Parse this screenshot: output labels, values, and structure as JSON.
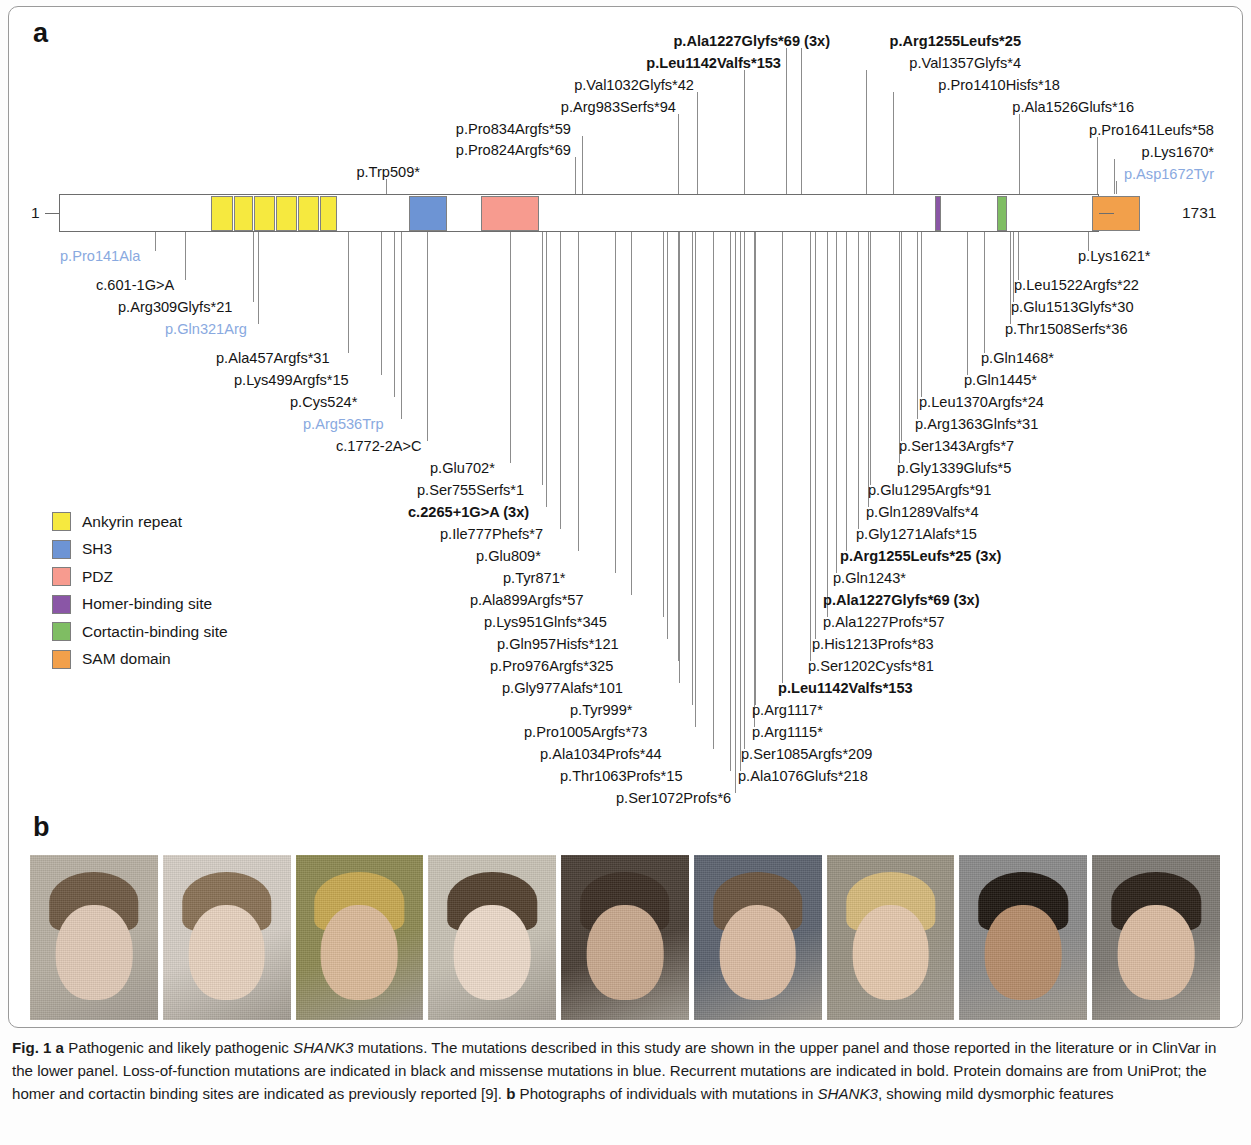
{
  "figure": {
    "panel_a_letter": "a",
    "panel_b_letter": "b",
    "caption_parts": {
      "fig_label": "Fig. 1",
      "a_tag": "a",
      "a_text_1": " Pathogenic and likely pathogenic ",
      "gene_1": "SHANK3",
      "a_text_2": " mutations. The mutations described in this study are shown in the upper panel and those reported in the literature or in ClinVar in the lower panel. Loss-of-function mutations are indicated in black and missense mutations in blue. Recurrent mutations are indicated in bold. Protein domains are from UniProt; the homer and cortactin binding sites are indicated as previously reported [9]. ",
      "b_tag": "b",
      "b_text_1": " Photographs of individuals with mutations in ",
      "gene_2": "SHANK3",
      "b_text_2": ", showing mild dysmorphic features"
    }
  },
  "protein": {
    "n_terminus_label": "1",
    "c_terminus_label": "1731",
    "length_aa": 1731,
    "domains": [
      {
        "name": "Ankyrin repeat",
        "color": "#f6e93f",
        "start_px": 152,
        "width_px": 22
      },
      {
        "name": "Ankyrin repeat",
        "color": "#f6e93f",
        "start_px": 175,
        "width_px": 19
      },
      {
        "name": "Ankyrin repeat",
        "color": "#f6e93f",
        "start_px": 195,
        "width_px": 21
      },
      {
        "name": "Ankyrin repeat",
        "color": "#f6e93f",
        "start_px": 217,
        "width_px": 21
      },
      {
        "name": "Ankyrin repeat",
        "color": "#f6e93f",
        "start_px": 239,
        "width_px": 21
      },
      {
        "name": "Ankyrin repeat",
        "color": "#f6e93f",
        "start_px": 261,
        "width_px": 17
      },
      {
        "name": "SH3",
        "color": "#6d94d4",
        "start_px": 350,
        "width_px": 38
      },
      {
        "name": "PDZ",
        "color": "#f79b8f",
        "start_px": 422,
        "width_px": 58
      },
      {
        "name": "Homer-binding site",
        "color": "#8a56a6",
        "start_px": 876,
        "width_px": 6
      },
      {
        "name": "Cortactin-binding site",
        "color": "#7fbd63",
        "start_px": 938,
        "width_px": 10
      },
      {
        "name": "SAM domain",
        "color": "#f2a04b",
        "start_px": 1033,
        "width_px": 48
      }
    ]
  },
  "legend": {
    "items": [
      {
        "label": "Ankyrin repeat",
        "color": "#f6e93f"
      },
      {
        "label": "SH3",
        "color": "#6d94d4"
      },
      {
        "label": "PDZ",
        "color": "#f79b8f"
      },
      {
        "label": "Homer-binding site",
        "color": "#8a56a6"
      },
      {
        "label": "Cortactin-binding site",
        "color": "#7fbd63"
      },
      {
        "label": "SAM domain",
        "color": "#f2a04b"
      }
    ]
  },
  "mutations_upper": [
    {
      "label": "p.Trp509*",
      "text_x": 420,
      "text_y": 165,
      "align": "right",
      "anchor_x": 386,
      "bold": false,
      "blue": false
    },
    {
      "label": "p.Pro824Argfs*69",
      "text_x": 571,
      "text_y": 143,
      "align": "right",
      "anchor_x": 575,
      "bold": false,
      "blue": false
    },
    {
      "label": "p.Pro834Argfs*59",
      "text_x": 571,
      "text_y": 122,
      "align": "right",
      "anchor_x": 582,
      "bold": false,
      "blue": false
    },
    {
      "label": "p.Arg983Serfs*94",
      "text_x": 676,
      "text_y": 100,
      "align": "right",
      "anchor_x": 678,
      "bold": false,
      "blue": false
    },
    {
      "label": "p.Val1032Glyfs*42",
      "text_x": 694,
      "text_y": 78,
      "align": "right",
      "anchor_x": 697,
      "bold": false,
      "blue": false
    },
    {
      "label": "p.Leu1142Valfs*153",
      "text_x": 781,
      "text_y": 56,
      "align": "right",
      "anchor_x": 744,
      "bold": true,
      "blue": false
    },
    {
      "label": "p.Ala1227Glyfs*69 (3x)",
      "text_x": 830,
      "text_y": 34,
      "align": "right",
      "anchor_x": 786,
      "bold": true,
      "blue": false
    },
    {
      "label": "p.Arg1255Leufs*25",
      "text_x": 1021,
      "text_y": 34,
      "align": "right",
      "anchor_x": 801,
      "bold": true,
      "blue": false
    },
    {
      "label": "p.Val1357Glyfs*4",
      "text_x": 1021,
      "text_y": 56,
      "align": "right",
      "anchor_x": 866,
      "bold": false,
      "blue": false
    },
    {
      "label": "p.Pro1410Hisfs*18",
      "text_x": 1060,
      "text_y": 78,
      "align": "right",
      "anchor_x": 893,
      "bold": false,
      "blue": false
    },
    {
      "label": "p.Ala1526Glufs*16",
      "text_x": 1134,
      "text_y": 100,
      "align": "right",
      "anchor_x": 1019,
      "bold": false,
      "blue": false
    },
    {
      "label": "p.Pro1641Leufs*58",
      "text_x": 1214,
      "text_y": 123,
      "align": "right",
      "anchor_x": 1097,
      "bold": false,
      "blue": false
    },
    {
      "label": "p.Lys1670*",
      "text_x": 1214,
      "text_y": 145,
      "align": "right",
      "anchor_x": 1114,
      "bold": false,
      "blue": false
    },
    {
      "label": "p.Asp1672Tyr",
      "text_x": 1214,
      "text_y": 167,
      "align": "right",
      "anchor_x": 1116,
      "bold": false,
      "blue": true
    }
  ],
  "mutations_lower_left": [
    {
      "label": "p.Pro141Ala",
      "text_x": 60,
      "text_y": 249,
      "anchor_x": 155,
      "bold": false,
      "blue": true
    },
    {
      "label": "c.601-1G>A",
      "text_x": 96,
      "text_y": 278,
      "anchor_x": 185,
      "bold": false,
      "blue": false
    },
    {
      "label": "p.Arg309Glyfs*21",
      "text_x": 118,
      "text_y": 300,
      "anchor_x": 253,
      "bold": false,
      "blue": false
    },
    {
      "label": "p.Gln321Arg",
      "text_x": 165,
      "text_y": 322,
      "anchor_x": 258,
      "bold": false,
      "blue": true
    },
    {
      "label": "p.Ala457Argfs*31",
      "text_x": 216,
      "text_y": 351,
      "anchor_x": 348,
      "bold": false,
      "blue": false
    },
    {
      "label": "p.Lys499Argfs*15",
      "text_x": 234,
      "text_y": 373,
      "anchor_x": 381,
      "bold": false,
      "blue": false
    },
    {
      "label": "p.Cys524*",
      "text_x": 290,
      "text_y": 395,
      "anchor_x": 394,
      "bold": false,
      "blue": false
    },
    {
      "label": "p.Arg536Trp",
      "text_x": 303,
      "text_y": 417,
      "anchor_x": 401,
      "bold": false,
      "blue": true
    },
    {
      "label": "c.1772-2A>C",
      "text_x": 336,
      "text_y": 439,
      "anchor_x": 427,
      "bold": false,
      "blue": false
    },
    {
      "label": "p.Glu702*",
      "text_x": 430,
      "text_y": 461,
      "anchor_x": 510,
      "bold": false,
      "blue": false
    },
    {
      "label": "p.Ser755Serfs*1",
      "text_x": 417,
      "text_y": 483,
      "anchor_x": 542,
      "bold": false,
      "blue": false
    },
    {
      "label": "c.2265+1G>A (3x)",
      "text_x": 408,
      "text_y": 505,
      "anchor_x": 546,
      "bold": true,
      "blue": false
    },
    {
      "label": "p.Ile777Phefs*7",
      "text_x": 440,
      "text_y": 527,
      "anchor_x": 560,
      "bold": false,
      "blue": false
    },
    {
      "label": "p.Glu809*",
      "text_x": 476,
      "text_y": 549,
      "anchor_x": 578,
      "bold": false,
      "blue": false
    },
    {
      "label": "p.Tyr871*",
      "text_x": 503,
      "text_y": 571,
      "anchor_x": 615,
      "bold": false,
      "blue": false
    },
    {
      "label": "p.Ala899Argfs*57",
      "text_x": 470,
      "text_y": 593,
      "anchor_x": 631,
      "bold": false,
      "blue": false
    },
    {
      "label": "p.Lys951Glnfs*345",
      "text_x": 484,
      "text_y": 615,
      "anchor_x": 663,
      "bold": false,
      "blue": false
    },
    {
      "label": "p.Gln957Hisfs*121",
      "text_x": 497,
      "text_y": 637,
      "anchor_x": 667,
      "bold": false,
      "blue": false
    },
    {
      "label": "p.Pro976Argfs*325",
      "text_x": 490,
      "text_y": 659,
      "anchor_x": 678,
      "bold": false,
      "blue": false
    },
    {
      "label": "p.Gly977Alafs*101",
      "text_x": 502,
      "text_y": 681,
      "anchor_x": 679,
      "bold": false,
      "blue": false
    },
    {
      "label": "p.Tyr999*",
      "text_x": 570,
      "text_y": 703,
      "anchor_x": 692,
      "bold": false,
      "blue": false
    },
    {
      "label": "p.Pro1005Argfs*73",
      "text_x": 524,
      "text_y": 725,
      "anchor_x": 695,
      "bold": false,
      "blue": false
    },
    {
      "label": "p.Ala1034Profs*44",
      "text_x": 540,
      "text_y": 747,
      "anchor_x": 713,
      "bold": false,
      "blue": false
    },
    {
      "label": "p.Thr1063Profs*15",
      "text_x": 560,
      "text_y": 769,
      "anchor_x": 730,
      "bold": false,
      "blue": false
    },
    {
      "label": "p.Ser1072Profs*6",
      "text_x": 616,
      "text_y": 791,
      "anchor_x": 735,
      "bold": false,
      "blue": false
    }
  ],
  "mutations_lower_right": [
    {
      "label": "p.Lys1621*",
      "text_x": 1078,
      "text_y": 249,
      "anchor_x": 1088,
      "bold": false,
      "blue": false
    },
    {
      "label": "p.Leu1522Argfs*22",
      "text_x": 1014,
      "text_y": 278,
      "anchor_x": 1018,
      "bold": false,
      "blue": false
    },
    {
      "label": "p.Glu1513Glyfs*30",
      "text_x": 1011,
      "text_y": 300,
      "anchor_x": 1013,
      "bold": false,
      "blue": false
    },
    {
      "label": "p.Thr1508Serfs*36",
      "text_x": 1005,
      "text_y": 322,
      "anchor_x": 1010,
      "bold": false,
      "blue": false
    },
    {
      "label": "p.Gln1468*",
      "text_x": 981,
      "text_y": 351,
      "anchor_x": 984,
      "bold": false,
      "blue": false
    },
    {
      "label": "p.Gln1445*",
      "text_x": 964,
      "text_y": 373,
      "anchor_x": 967,
      "bold": false,
      "blue": false
    },
    {
      "label": "p.Leu1370Argfs*24",
      "text_x": 919,
      "text_y": 395,
      "anchor_x": 921,
      "bold": false,
      "blue": false
    },
    {
      "label": "p.Arg1363Glnfs*31",
      "text_x": 915,
      "text_y": 417,
      "anchor_x": 917,
      "bold": false,
      "blue": false
    },
    {
      "label": "p.Ser1343Argfs*7",
      "text_x": 899,
      "text_y": 439,
      "anchor_x": 901,
      "bold": false,
      "blue": false
    },
    {
      "label": "p.Gly1339Glufs*5",
      "text_x": 897,
      "text_y": 461,
      "anchor_x": 899,
      "bold": false,
      "blue": false
    },
    {
      "label": "p.Glu1295Argfs*91",
      "text_x": 868,
      "text_y": 483,
      "anchor_x": 870,
      "bold": false,
      "blue": false
    },
    {
      "label": "p.Gln1289Valfs*4",
      "text_x": 866,
      "text_y": 505,
      "anchor_x": 868,
      "bold": false,
      "blue": false
    },
    {
      "label": "p.Gly1271Alafs*15",
      "text_x": 856,
      "text_y": 527,
      "anchor_x": 858,
      "bold": false,
      "blue": false
    },
    {
      "label": "p.Arg1255Leufs*25 (3x)",
      "text_x": 840,
      "text_y": 549,
      "anchor_x": 846,
      "bold": true,
      "blue": false
    },
    {
      "label": "p.Gln1243*",
      "text_x": 833,
      "text_y": 571,
      "anchor_x": 836,
      "bold": false,
      "blue": false
    },
    {
      "label": "p.Ala1227Glyfs*69 (3x)",
      "text_x": 823,
      "text_y": 593,
      "anchor_x": 827,
      "bold": true,
      "blue": false
    },
    {
      "label": "p.Ala1227Profs*57",
      "text_x": 823,
      "text_y": 615,
      "anchor_x": 827,
      "bold": false,
      "blue": false
    },
    {
      "label": "p.His1213Profs*83",
      "text_x": 812,
      "text_y": 637,
      "anchor_x": 815,
      "bold": false,
      "blue": false
    },
    {
      "label": "p.Ser1202Cysfs*81",
      "text_x": 808,
      "text_y": 659,
      "anchor_x": 810,
      "bold": false,
      "blue": false
    },
    {
      "label": "p.Leu1142Valfs*153",
      "text_x": 778,
      "text_y": 681,
      "anchor_x": 782,
      "bold": true,
      "blue": false
    },
    {
      "label": "p.Arg1117*",
      "text_x": 752,
      "text_y": 703,
      "anchor_x": 755,
      "bold": false,
      "blue": false
    },
    {
      "label": "p.Arg1115*",
      "text_x": 752,
      "text_y": 725,
      "anchor_x": 754,
      "bold": false,
      "blue": false
    },
    {
      "label": "p.Ser1085Argfs*209",
      "text_x": 741,
      "text_y": 747,
      "anchor_x": 744,
      "bold": false,
      "blue": false
    },
    {
      "label": "p.Ala1076Glufs*218",
      "text_x": 738,
      "text_y": 769,
      "anchor_x": 740,
      "bold": false,
      "blue": false
    }
  ],
  "photos": [
    {
      "bg": "#b9b1a4",
      "hair": "#6f5a44",
      "face": "#e2cbb8"
    },
    {
      "bg": "#d6cfc6",
      "hair": "#8a7256",
      "face": "#e8d3c0"
    },
    {
      "bg": "#8e8a52",
      "hair": "#c8a951",
      "face": "#dcbb9a"
    },
    {
      "bg": "#c9c3b6",
      "hair": "#53412f",
      "face": "#eddbcb"
    },
    {
      "bg": "#4a3f36",
      "hair": "#3b2e24",
      "face": "#c9a98f"
    },
    {
      "bg": "#5d6470",
      "hair": "#6b5540",
      "face": "#dcbda4"
    },
    {
      "bg": "#9a9383",
      "hair": "#d7bb7c",
      "face": "#e6c9ae"
    },
    {
      "bg": "#8b8b8b",
      "hair": "#1f1812",
      "face": "#b78d6b"
    },
    {
      "bg": "#7e7a74",
      "hair": "#2b2119",
      "face": "#dcbda3"
    }
  ]
}
